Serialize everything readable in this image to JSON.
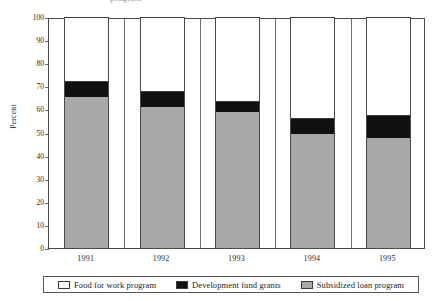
{
  "figure": {
    "clipped_title": "program",
    "background_color": "#ffffff"
  },
  "axes": {
    "ylabel": "Percent",
    "yticks": [
      "100",
      "90",
      "80",
      "70",
      "60",
      "50",
      "40",
      "30",
      "20",
      "10",
      "0"
    ],
    "xticks": [
      "1991",
      "1992",
      "1993",
      "1994",
      "1995"
    ]
  },
  "legend": {
    "items": [
      {
        "label": "Food for work program",
        "color": "#ffffff",
        "swatch": "sw-white"
      },
      {
        "label": "Development fund grants",
        "color": "#111111",
        "swatch": "sw-black"
      },
      {
        "label": "Subsidized loan program",
        "color": "#a8a8a8",
        "swatch": "sw-gray"
      }
    ]
  },
  "chart_data": {
    "type": "bar",
    "subtype": "stacked-100-percent",
    "title": "program",
    "xlabel": "",
    "ylabel": "Percent",
    "ylim": [
      0,
      100
    ],
    "ytick_step": 10,
    "grid": false,
    "legend_position": "bottom",
    "categories": [
      "1991",
      "1992",
      "1993",
      "1994",
      "1995"
    ],
    "series": [
      {
        "name": "Subsidized loan program",
        "color": "#a8a8a8",
        "values": [
          65.5,
          61.0,
          59.0,
          49.5,
          47.5
        ]
      },
      {
        "name": "Development fund grants",
        "color": "#111111",
        "values": [
          7.0,
          7.0,
          4.5,
          7.0,
          10.0
        ]
      },
      {
        "name": "Food for work program",
        "color": "#ffffff",
        "values": [
          27.5,
          32.0,
          36.5,
          43.5,
          42.5
        ]
      }
    ],
    "cumulative_tops": {
      "Subsidized loan program": [
        65.5,
        61.0,
        59.0,
        49.5,
        47.5
      ],
      "Development fund grants": [
        72.5,
        68.0,
        63.5,
        56.5,
        57.5
      ],
      "Food for work program": [
        100,
        100,
        100,
        100,
        100
      ]
    }
  }
}
